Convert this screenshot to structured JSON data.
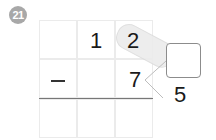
{
  "problem": {
    "number": "21",
    "operator": "−",
    "minuend": {
      "tens": "1",
      "ones": "2"
    },
    "subtrahend": {
      "ones": "7"
    },
    "decomposition": {
      "source": "7",
      "part_blank": "",
      "part_given": "5"
    },
    "answer": {
      "tens": "",
      "ones": ""
    }
  },
  "colors": {
    "badge": "#a8a8a8",
    "grid_line": "#ebebeb",
    "answer_line": "#777777",
    "highlight_pill": "#ececec",
    "box_border": "#8c8c8c"
  }
}
